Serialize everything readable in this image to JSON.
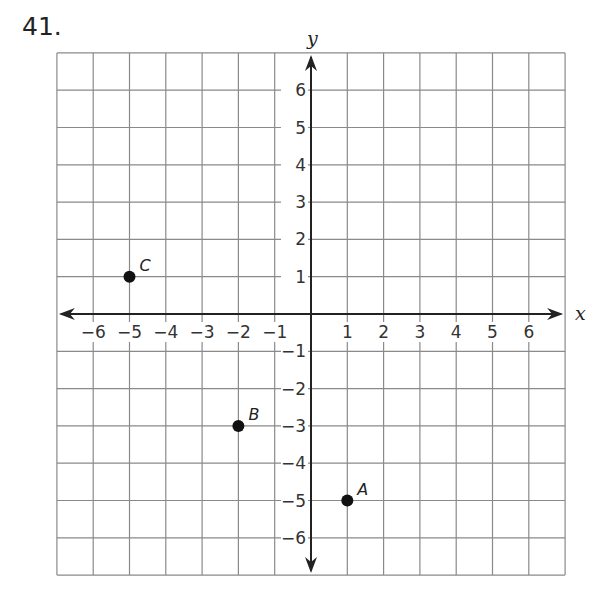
{
  "problem_number": "41.",
  "chart_data": {
    "type": "scatter",
    "title": "",
    "xlabel": "x",
    "ylabel": "y",
    "xlim": [
      -7,
      7
    ],
    "ylim": [
      -7,
      7
    ],
    "grid": true,
    "x_ticks": [
      -6,
      -5,
      -4,
      -3,
      -2,
      -1,
      1,
      2,
      3,
      4,
      5,
      6
    ],
    "y_ticks": [
      6,
      5,
      4,
      3,
      2,
      1,
      -1,
      -2,
      -3,
      -4,
      -5,
      -6
    ],
    "x_tick_labels": [
      "−6",
      "−5",
      "−4",
      "−3",
      "−2",
      "−1",
      "1",
      "2",
      "3",
      "4",
      "5",
      "6"
    ],
    "y_tick_labels": [
      "6",
      "5",
      "4",
      "3",
      "2",
      "1",
      "−1",
      "−2",
      "−3",
      "−4",
      "−5",
      "−6"
    ],
    "points": [
      {
        "label": "C",
        "x": -5,
        "y": 1
      },
      {
        "label": "B",
        "x": -2,
        "y": -3
      },
      {
        "label": "A",
        "x": 1,
        "y": -5
      }
    ]
  }
}
